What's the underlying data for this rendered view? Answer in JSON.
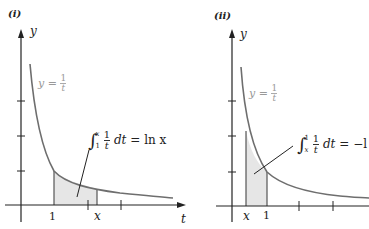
{
  "panels": [
    {
      "label": "(i)",
      "y_axis_label": "y",
      "t_axis_label": "t",
      "curve_label": {
        "lhs": "y",
        "eq": "=",
        "num": "1",
        "den": "t"
      },
      "integral": {
        "lower": "1",
        "upper": "x",
        "num": "1",
        "den": "t",
        "dt": "dt",
        "eq": "=",
        "rhs": "ln x"
      },
      "tick_labels": [
        "1",
        "x"
      ],
      "shaded_from": "1",
      "shaded_to": "x"
    },
    {
      "label": "(ii)",
      "y_axis_label": "y",
      "curve_label": {
        "lhs": "y",
        "eq": "=",
        "num": "1",
        "den": "t"
      },
      "integral": {
        "lower": "x",
        "upper": "1",
        "num": "1",
        "den": "t",
        "dt": "dt",
        "eq": "=",
        "rhs": "−l"
      },
      "tick_labels": [
        "x",
        "1"
      ],
      "shaded_from": "x",
      "shaded_to": "1"
    }
  ],
  "colors": {
    "curve": "#6e6e6e",
    "shade": "#e6e6e6",
    "axis": "#222222",
    "curve_label": "#999999"
  }
}
